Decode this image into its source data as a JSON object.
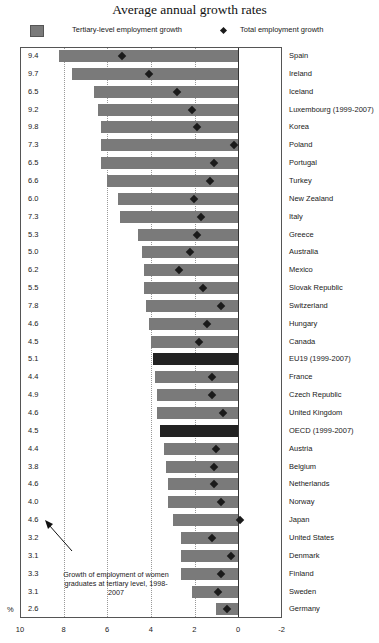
{
  "title": "Average annual growth rates",
  "legend": {
    "series1": "Tertiary-level employment growth",
    "series2": "Total employment growth"
  },
  "annotation": "Growth of employment of women graduates at tertiary level, 1998-2007",
  "unit_label": "%",
  "colors": {
    "bar": "#7a7a7a",
    "aggregate_bar": "#222222",
    "diamond": "#1a1a1a"
  },
  "chart_data": {
    "type": "bar",
    "orientation": "horizontal",
    "title": "Average annual growth rates",
    "xlabel": "%",
    "ylabel": "",
    "xlim": [
      10,
      -2
    ],
    "xticks": [
      10,
      8,
      6,
      4,
      2,
      0,
      -2
    ],
    "grid": true,
    "legend_position": "top",
    "categories": [
      "Spain",
      "Ireland",
      "Iceland",
      "Luxembourg (1999-2007)",
      "Korea",
      "Poland",
      "Portugal",
      "Turkey",
      "New Zealand",
      "Italy",
      "Greece",
      "Australia",
      "Mexico",
      "Slovak Republic",
      "Switzerland",
      "Hungary",
      "Canada",
      "EU19 (1999-2007)",
      "France",
      "Czech Republic",
      "United Kingdom",
      "OECD (1999-2007)",
      "Austria",
      "Belgium",
      "Netherlands",
      "Norway",
      "Japan",
      "United States",
      "Denmark",
      "Finland",
      "Sweden",
      "Germany"
    ],
    "series": [
      {
        "name": "Tertiary-level employment growth",
        "type": "bar",
        "values": [
          8.2,
          7.6,
          6.6,
          6.4,
          6.3,
          6.3,
          6.3,
          6.0,
          5.5,
          5.4,
          4.6,
          4.4,
          4.3,
          4.3,
          4.2,
          4.1,
          4.0,
          3.9,
          3.8,
          3.7,
          3.7,
          3.6,
          3.4,
          3.3,
          3.2,
          3.2,
          3.0,
          2.6,
          2.6,
          2.6,
          2.1,
          1.0
        ]
      },
      {
        "name": "Total employment growth",
        "type": "scatter",
        "marker": "diamond",
        "values": [
          5.3,
          4.1,
          2.8,
          2.1,
          1.9,
          0.2,
          1.1,
          1.3,
          2.0,
          1.7,
          1.9,
          2.2,
          2.7,
          1.6,
          0.8,
          1.4,
          1.8,
          null,
          1.2,
          1.2,
          0.7,
          null,
          1.0,
          1.1,
          1.1,
          0.8,
          -0.1,
          1.2,
          0.3,
          0.8,
          0.9,
          0.5
        ]
      },
      {
        "name": "Growth of employment of women graduates at tertiary level, 1998-2007",
        "type": "table_column",
        "values": [
          9.4,
          9.7,
          6.5,
          9.2,
          9.8,
          7.3,
          6.5,
          6.6,
          6.0,
          7.3,
          5.3,
          5.0,
          6.2,
          5.5,
          7.8,
          4.6,
          4.5,
          5.1,
          4.4,
          4.9,
          4.6,
          4.5,
          4.4,
          3.8,
          4.6,
          4.0,
          4.6,
          3.2,
          3.1,
          3.3,
          3.1,
          2.6
        ]
      }
    ],
    "aggregates": [
      "EU19 (1999-2007)",
      "OECD (1999-2007)"
    ],
    "annotations": [
      "Growth of employment of women graduates at tertiary level, 1998-2007"
    ]
  }
}
